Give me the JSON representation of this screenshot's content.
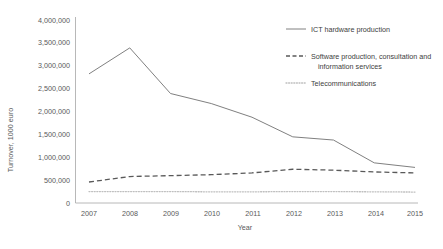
{
  "chart_data": {
    "type": "line",
    "title": "",
    "xlabel": "Year",
    "ylabel": "Turnover, 1000 euro",
    "categories": [
      "2007",
      "2008",
      "2009",
      "2010",
      "2011",
      "2012",
      "2013",
      "2014",
      "2015"
    ],
    "x": [
      2007,
      2008,
      2009,
      2010,
      2011,
      2012,
      2013,
      2014,
      2015
    ],
    "ylim": [
      0,
      4000000
    ],
    "xlim": [
      2007,
      2015
    ],
    "grid": false,
    "legend_position": "top-right",
    "ytick_labels": [
      "0",
      "500,000",
      "1,000,000",
      "1,500,000",
      "2,000,000",
      "2,500,000",
      "3,000,000",
      "3,500,000",
      "4,000,000"
    ],
    "ytick_values": [
      0,
      500000,
      1000000,
      1500000,
      2000000,
      2500000,
      3000000,
      3500000,
      4000000
    ],
    "series": [
      {
        "name": "ICT hardware production",
        "style": "solid",
        "color": "#808080",
        "values": [
          2830000,
          3400000,
          2400000,
          2180000,
          1880000,
          1450000,
          1380000,
          880000,
          780000
        ]
      },
      {
        "name": "Software production, consultation and information services",
        "style": "dashed",
        "color": "#595959",
        "values": [
          460000,
          580000,
          600000,
          620000,
          660000,
          740000,
          720000,
          680000,
          660000
        ]
      },
      {
        "name": "Telecommunications",
        "style": "dotted",
        "color": "#bfbfbf",
        "values": [
          250000,
          250000,
          250000,
          245000,
          245000,
          250000,
          250000,
          245000,
          240000
        ]
      }
    ]
  },
  "legend": {
    "items": [
      {
        "label": "ICT hardware production"
      },
      {
        "label": "Software production, consultation and",
        "label2": "information services"
      },
      {
        "label": "Telecommunications"
      }
    ]
  }
}
